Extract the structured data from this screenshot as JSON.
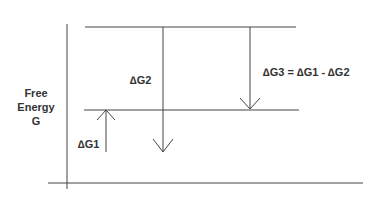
{
  "axis": {
    "title_line1": "Free",
    "title_line2": "Energy",
    "title_line3": "G"
  },
  "labels": {
    "dg1": "∆G1",
    "dg2": "∆G2",
    "dg3": "∆G3 = ∆G1 - ∆G2"
  },
  "colors": {
    "line": "#444444",
    "text": "#333333"
  }
}
